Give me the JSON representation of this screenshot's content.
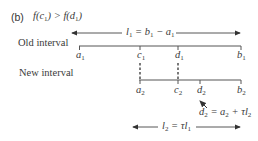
{
  "title": {
    "prefix": "(b)",
    "condition": "f(c₁) > f(d₁)"
  },
  "old_interval": {
    "label": "Old interval",
    "length_formula": "l₁ = b₁ − a₁",
    "points": [
      {
        "name": "a",
        "sub": "1",
        "x": 80
      },
      {
        "name": "c",
        "sub": "1",
        "x": 140
      },
      {
        "name": "d",
        "sub": "1",
        "x": 178
      },
      {
        "name": "b",
        "sub": "1",
        "x": 241
      }
    ]
  },
  "new_interval": {
    "label": "New interval",
    "length_formula": "l₂ = τl₁",
    "points": [
      {
        "name": "a",
        "sub": "2",
        "x": 140
      },
      {
        "name": "c",
        "sub": "2",
        "x": 178
      },
      {
        "name": "d",
        "sub": "2",
        "x": 201
      },
      {
        "name": "b",
        "sub": "2",
        "x": 241
      }
    ],
    "annotation": "d₂ = a₂ + τl₂"
  },
  "colors": {
    "line": "#444444",
    "text": "#3a3a3a"
  }
}
